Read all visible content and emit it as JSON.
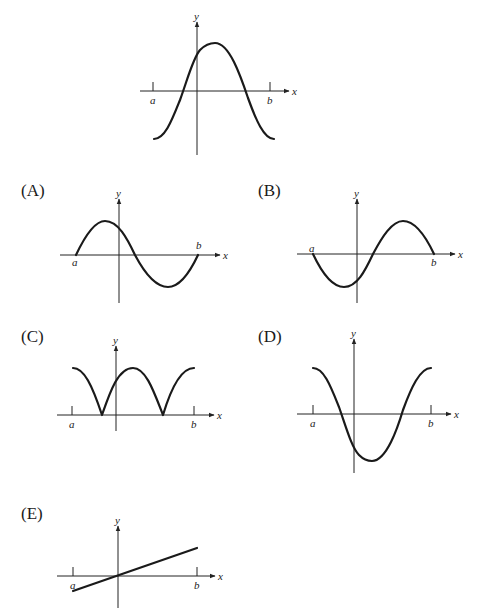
{
  "question_figure": {
    "axis_labels": {
      "x": "x",
      "y": "y"
    },
    "tick_labels": {
      "a": "a",
      "b": "b"
    },
    "description": "Graph of f on [a,b]: starts low at a, rises through the x-axis, peaks just right of the y-axis, falls through the x-axis, ends low at b (cosine-like hump)."
  },
  "options": [
    {
      "label": "(A)",
      "axis_x": "x",
      "axis_y": "y",
      "tick_a": "a",
      "tick_b": "b",
      "shape": "starts at zero at a, rises to a max left of y-axis, decreases through zero, min right, returns to zero at b"
    },
    {
      "label": "(B)",
      "axis_x": "x",
      "axis_y": "y",
      "tick_a": "a",
      "tick_b": "b",
      "shape": "starts at zero at a, decreases to a min left of y-axis, increases through zero, max right, returns to zero at b"
    },
    {
      "label": "(C)",
      "axis_x": "x",
      "axis_y": "y",
      "tick_a": "a",
      "tick_b": "b",
      "shape": "absolute value of original: non-negative with two cusps at the zeros"
    },
    {
      "label": "(D)",
      "axis_x": "x",
      "axis_y": "y",
      "tick_a": "a",
      "tick_b": "b",
      "shape": "reflection of original across x-axis: starts high, min right of y-axis, ends high"
    },
    {
      "label": "(E)",
      "axis_x": "x",
      "axis_y": "y",
      "tick_a": "a",
      "tick_b": "b",
      "shape": "straight line through origin with positive slope"
    }
  ],
  "colors": {
    "ink": "#1a1a1a",
    "background": "#ffffff"
  }
}
